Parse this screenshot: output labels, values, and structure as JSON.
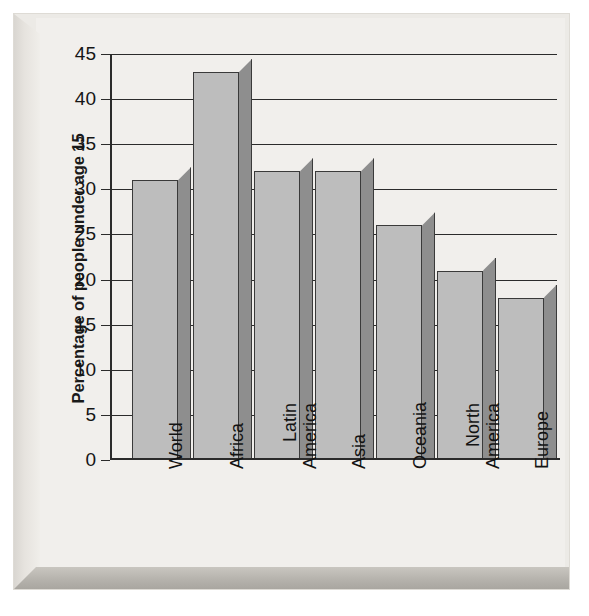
{
  "chart_data": {
    "type": "bar",
    "title": "",
    "xlabel": "",
    "ylabel": "Percentage of people under age 15",
    "categories": [
      "World",
      "Africa",
      "Latin America",
      "Asia",
      "Oceania",
      "North America",
      "Europe"
    ],
    "values": [
      31,
      43,
      32,
      32,
      26,
      21,
      18
    ],
    "series": [
      {
        "name": "Percentage of people under age 15",
        "values": [
          31,
          43,
          32,
          32,
          26,
          21,
          18
        ]
      }
    ],
    "ylim": [
      0,
      45
    ],
    "ytick_interval": 5,
    "ytick_labels": [
      "0",
      "5",
      "10",
      "15",
      "20",
      "25",
      "30",
      "35",
      "40",
      "45"
    ],
    "ytick_values": [
      0,
      5,
      10,
      15,
      20,
      25,
      30,
      35,
      40,
      45
    ],
    "grid": true,
    "grid_axis": "y",
    "legend": false,
    "legend_position": "none",
    "bar_style": "3d-block",
    "annotations": []
  },
  "colors": {
    "page_background": "#ffffff",
    "panel_face": "#f1efec",
    "panel_edge_light": "#e6e3de",
    "panel_edge_shadow": "#b2afa9",
    "plot_background": "#f1efec",
    "bar_front": "#bdbdbd",
    "bar_side": "#8e8e8e",
    "bar_top": "#cfcfcf",
    "bar_outline": "#3a3a3a",
    "gridline": "#2b2b2b",
    "axis": "#2b2b2b",
    "text": "#131313"
  }
}
